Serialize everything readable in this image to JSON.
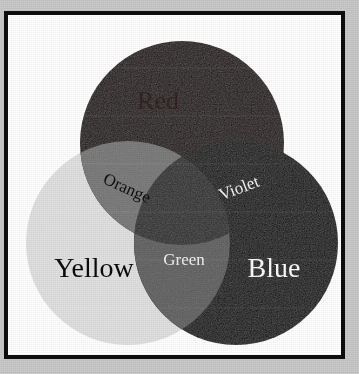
{
  "figure": {
    "type": "venn-diagram",
    "background_color": "#c9c9c9",
    "frame_color": "#0d0d0d",
    "plate_color": "#ffffff"
  },
  "circles": [
    {
      "id": "red",
      "label": "Red",
      "color": "#1d0c0b",
      "label_color": "#2a1211",
      "cx": 174,
      "cy": 128,
      "r": 102
    },
    {
      "id": "yellow",
      "label": "Yellow",
      "color": "#e3e3e3",
      "label_color": "#0a0a0a",
      "cx": 120,
      "cy": 228,
      "r": 102
    },
    {
      "id": "blue",
      "label": "Blue",
      "color": "#070707",
      "label_color": "#fbfbfb",
      "cx": 228,
      "cy": 228,
      "r": 102
    }
  ],
  "intersections": [
    {
      "id": "orange",
      "label": "Orange",
      "parents": [
        "red",
        "yellow"
      ],
      "color": "#757575",
      "label_color": "#100f0d",
      "rotation_deg": 24
    },
    {
      "id": "violet",
      "label": "Violet",
      "parents": [
        "red",
        "blue"
      ],
      "color": "#0a0a0a",
      "label_color": "#f4f4f4",
      "rotation_deg": -21
    },
    {
      "id": "green",
      "label": "Green",
      "parents": [
        "yellow",
        "blue"
      ],
      "color": "#5c5c5c",
      "label_color": "#f2f2f2",
      "rotation_deg": 0
    },
    {
      "id": "center",
      "label": "",
      "parents": [
        "red",
        "yellow",
        "blue"
      ],
      "color": "#2b2b2b",
      "label_color": "#2b2b2b",
      "rotation_deg": 0
    }
  ]
}
